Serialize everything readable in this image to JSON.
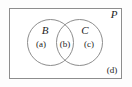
{
  "figure": {
    "type": "venn-diagram",
    "universe": {
      "label": "P",
      "corner_label": "(d)"
    },
    "sets": [
      {
        "name": "B",
        "region_label": "(a)"
      },
      {
        "name": "C",
        "region_label": "(c)"
      }
    ],
    "intersection": {
      "region_label": "(b)"
    },
    "colors": {
      "stroke": "#8d8d8d",
      "text": "#1d1d1d",
      "background": "#ffffff"
    }
  }
}
